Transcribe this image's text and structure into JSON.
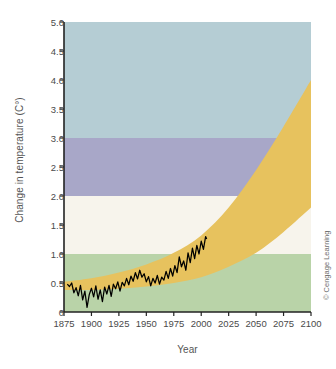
{
  "figure": {
    "credit": "© Cengage Learning"
  },
  "chart_data": {
    "type": "area",
    "title": "",
    "subtitle": "",
    "xlabel": "Year",
    "ylabel": "Change in temperature (C°)",
    "xlim": [
      1875,
      2100
    ],
    "ylim": [
      0,
      5.0
    ],
    "grid": false,
    "legend_position": "none",
    "xticks": [
      1875,
      1900,
      1925,
      1950,
      1975,
      2000,
      2025,
      2050,
      2075,
      2100
    ],
    "xtick_labels": [
      "1875",
      "1900",
      "1925",
      "1950",
      "1975",
      "2000",
      "2025",
      "2050",
      "2075",
      "2100"
    ],
    "yticks": [
      0,
      0.5,
      1.0,
      1.5,
      2.0,
      2.5,
      3.0,
      3.5,
      4.0,
      4.5,
      5.0
    ],
    "ytick_labels": [
      "0",
      "0.5",
      "1.0",
      "1.5",
      "2.0",
      "2.5",
      "3.0",
      "3.5",
      "4.0",
      "4.5",
      "5.0"
    ],
    "background_bands": [
      {
        "name": "low-risk-band",
        "from": 0.0,
        "to": 1.0,
        "color": "#b9d3a8"
      },
      {
        "name": "moderate-risk-band",
        "from": 1.0,
        "to": 2.0,
        "color": "#f7f4ec"
      },
      {
        "name": "high-risk-band",
        "from": 2.0,
        "to": 3.0,
        "color": "#a8a7c8"
      },
      {
        "name": "severe-risk-band",
        "from": 3.0,
        "to": 5.0,
        "color": "#b5cdd4"
      }
    ],
    "projection_band": {
      "name": "projected-warming-range",
      "color": "#e7c25e",
      "x": [
        1875,
        1900,
        1925,
        1950,
        1975,
        2000,
        2025,
        2050,
        2075,
        2100
      ],
      "upper": [
        0.52,
        0.58,
        0.68,
        0.82,
        1.02,
        1.32,
        1.8,
        2.45,
        3.2,
        4.0
      ],
      "lower": [
        0.38,
        0.38,
        0.4,
        0.44,
        0.5,
        0.6,
        0.78,
        1.02,
        1.38,
        1.8
      ]
    },
    "series": [
      {
        "name": "observed-temperature",
        "type": "line",
        "color": "#000000",
        "x": [
          1878,
          1880,
          1882,
          1884,
          1886,
          1888,
          1890,
          1892,
          1894,
          1896,
          1898,
          1900,
          1902,
          1904,
          1906,
          1908,
          1910,
          1912,
          1914,
          1916,
          1918,
          1920,
          1922,
          1924,
          1926,
          1928,
          1930,
          1932,
          1934,
          1936,
          1938,
          1940,
          1942,
          1944,
          1946,
          1948,
          1950,
          1952,
          1954,
          1956,
          1958,
          1960,
          1962,
          1964,
          1966,
          1968,
          1970,
          1972,
          1974,
          1976,
          1978,
          1980,
          1982,
          1984,
          1986,
          1988,
          1990,
          1992,
          1994,
          1996,
          1998,
          2000,
          2002,
          2004,
          2005
        ],
        "y": [
          0.48,
          0.44,
          0.5,
          0.33,
          0.42,
          0.28,
          0.46,
          0.21,
          0.36,
          0.08,
          0.3,
          0.41,
          0.26,
          0.45,
          0.22,
          0.38,
          0.18,
          0.43,
          0.31,
          0.46,
          0.27,
          0.48,
          0.4,
          0.52,
          0.36,
          0.51,
          0.45,
          0.58,
          0.47,
          0.62,
          0.53,
          0.68,
          0.57,
          0.72,
          0.6,
          0.66,
          0.52,
          0.61,
          0.45,
          0.58,
          0.5,
          0.63,
          0.48,
          0.6,
          0.55,
          0.7,
          0.58,
          0.75,
          0.62,
          0.8,
          0.68,
          0.95,
          0.78,
          0.88,
          0.72,
          1.02,
          0.85,
          1.1,
          0.92,
          1.15,
          1.0,
          1.22,
          1.08,
          1.3,
          1.26
        ]
      }
    ]
  }
}
